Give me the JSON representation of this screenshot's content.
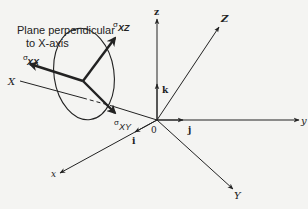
{
  "diagram": {
    "annotation": {
      "line1": "Plane perpendicular",
      "line2": "to X-axis"
    },
    "axes": {
      "fixed": {
        "x": "x",
        "y": "y",
        "z": "z"
      },
      "rotated": {
        "X": "X",
        "Y": "Y",
        "Z": "Z"
      },
      "unit_vectors": {
        "i": "i",
        "j": "j",
        "k": "k"
      },
      "origin": "0"
    },
    "stresses": {
      "sxx": {
        "symbol": "σ",
        "subscript": "XX"
      },
      "sxy": {
        "symbol": "σ",
        "subscript": "XY"
      },
      "sxz": {
        "symbol": "σ",
        "subscript": "XZ"
      }
    },
    "colors": {
      "ink": "#222222",
      "background": "#f4f4f2"
    }
  }
}
